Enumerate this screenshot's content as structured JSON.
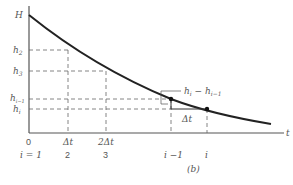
{
  "figure": {
    "caption": "(b)",
    "axis": {
      "x_label": "t",
      "y_label": "h"
    },
    "y_ticks": [
      {
        "label": "H",
        "sub": ""
      },
      {
        "label": "h",
        "sub": "2"
      },
      {
        "label": "h",
        "sub": "3"
      },
      {
        "label": "h",
        "sub": "i−1"
      },
      {
        "label": "h",
        "sub": "i"
      }
    ],
    "x_ticks": [
      "0",
      "Δt",
      "2Δt",
      "",
      ""
    ],
    "index_labels": [
      "i = 1",
      "2",
      "3",
      "i −1",
      "i"
    ],
    "annotation_diff": "h",
    "annotation_diff_sub1": "i",
    "annotation_diff_mid": " − h",
    "annotation_diff_sub2": "i−1",
    "annotation_dt": "Δt"
  }
}
